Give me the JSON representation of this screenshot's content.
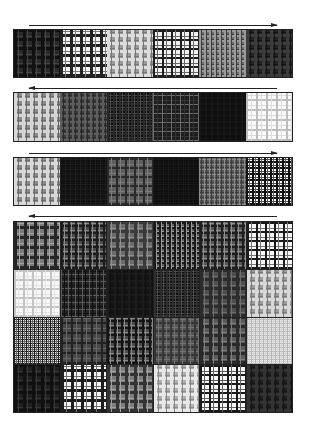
{
  "figure": {
    "arrows": [
      {
        "id": "arrow-1",
        "direction": "right",
        "top": 25,
        "left": 29,
        "width": 248
      },
      {
        "id": "arrow-2",
        "direction": "left",
        "top": 88,
        "left": 29,
        "width": 248
      },
      {
        "id": "arrow-3",
        "direction": "right",
        "top": 153,
        "left": 29,
        "width": 248
      },
      {
        "id": "arrow-4",
        "direction": "left",
        "top": 216,
        "left": 29,
        "width": 248
      }
    ],
    "strips": [
      {
        "id": "strip-1",
        "top": 29,
        "height": 49,
        "tiles": [
          {
            "bg": "#2a2a2a",
            "line": "#111111",
            "line2": "#444444",
            "period": 9,
            "width": 3
          },
          {
            "bg": "#f4f4f4",
            "line": "#222222",
            "line2": "#7a7a7a",
            "period": 10,
            "width": 3
          },
          {
            "bg": "#9a9a9a",
            "line": "#dcdcdc",
            "line2": "#777777",
            "period": 8,
            "width": 3
          },
          {
            "bg": "#f0f0f0",
            "line": "#1e1e1e",
            "line2": "#666666",
            "period": 9,
            "width": 2
          },
          {
            "bg": "#6d6d6d",
            "line": "#9a9a9a",
            "line2": "#3d3d3d",
            "period": 5,
            "width": 2
          },
          {
            "bg": "#232323",
            "line": "#3c3c3c",
            "line2": "#151515",
            "period": 8,
            "width": 3
          }
        ]
      },
      {
        "id": "strip-2",
        "top": 92,
        "height": 50,
        "tiles": [
          {
            "bg": "#8a8a8a",
            "line": "#d6d6d6",
            "line2": "#6a6a6a",
            "period": 8,
            "width": 3
          },
          {
            "bg": "#3e3e3e",
            "line": "#5e5e5e",
            "line2": "#2a2a2a",
            "period": 6,
            "width": 2
          },
          {
            "bg": "#0e0e0e",
            "line": "#2a2a2a",
            "line2": "#4a4a4a",
            "period": 6,
            "width": 2
          },
          {
            "bg": "#1e1e1e",
            "line": "#6a6a6a",
            "line2": "#333333",
            "period": 9,
            "width": 1
          },
          {
            "bg": "#0c0c0c",
            "line": "#161616",
            "line2": "#111111",
            "period": 6,
            "width": 2
          },
          {
            "bg": "#fafafa",
            "line": "#bdbdbd",
            "line2": "#dddddd",
            "period": 10,
            "width": 2
          }
        ]
      },
      {
        "id": "strip-3",
        "top": 157,
        "height": 49,
        "tiles": [
          {
            "bg": "#8c8c8c",
            "line": "#d9d9d9",
            "line2": "#6e6e6e",
            "period": 8,
            "width": 3
          },
          {
            "bg": "#0d0d0d",
            "line": "#1f1f1f",
            "line2": "#161616",
            "period": 5,
            "width": 1
          },
          {
            "bg": "#5e5e5e",
            "line": "#2a2a2a",
            "line2": "#7b7b7b",
            "period": 9,
            "width": 2
          },
          {
            "bg": "#0c0c0c",
            "line": "#1a1a1a",
            "line2": "#141414",
            "period": 5,
            "width": 1
          },
          {
            "bg": "#5a5a5a",
            "line": "#8a8a8a",
            "line2": "#3d3d3d",
            "period": 5,
            "width": 1
          },
          {
            "bg": "#ffffff",
            "line": "#111111",
            "line2": "#555555",
            "period": 6,
            "width": 2
          }
        ]
      }
    ],
    "grid": {
      "id": "grid-4x6",
      "rows": 4,
      "cols": 6,
      "tiles": [
        {
          "bg": "#7a7a7a",
          "line": "#262626",
          "line2": "#a5a5a5",
          "period": 10,
          "width": 3
        },
        {
          "bg": "#4a4a4a",
          "line": "#1c1c1c",
          "line2": "#8a8a8a",
          "period": 7,
          "width": 2
        },
        {
          "bg": "#6c6c6c",
          "line": "#3a3a3a",
          "line2": "#8f8f8f",
          "period": 9,
          "width": 3
        },
        {
          "bg": "#5c5c5c",
          "line": "#1a1a1a",
          "line2": "#9a9a9a",
          "period": 5,
          "width": 2
        },
        {
          "bg": "#555555",
          "line": "#1e1e1e",
          "line2": "#8d8d8d",
          "period": 7,
          "width": 2
        },
        {
          "bg": "#f6f6f6",
          "line": "#1a1a1a",
          "line2": "#777777",
          "period": 9,
          "width": 2
        },
        {
          "bg": "#f8f8f8",
          "line": "#c4c4c4",
          "line2": "#e4e4e4",
          "period": 9,
          "width": 2
        },
        {
          "bg": "#222222",
          "line": "#5a5a5a",
          "line2": "#111111",
          "period": 7,
          "width": 1
        },
        {
          "bg": "#141414",
          "line": "#1c1c1c",
          "line2": "#101010",
          "period": 7,
          "width": 2
        },
        {
          "bg": "#101010",
          "line": "#2e2e2e",
          "line2": "#4a4a4a",
          "period": 6,
          "width": 2
        },
        {
          "bg": "#4e4e4e",
          "line": "#2c2c2c",
          "line2": "#6e6e6e",
          "period": 9,
          "width": 3
        },
        {
          "bg": "#9a9a9a",
          "line": "#d8d8d8",
          "line2": "#7a7a7a",
          "period": 8,
          "width": 3
        },
        {
          "bg": "#e6e6e6",
          "line": "#1e1e1e",
          "line2": "#666666",
          "period": 4,
          "width": 1
        },
        {
          "bg": "#474747",
          "line": "#222222",
          "line2": "#686868",
          "period": 10,
          "width": 2
        },
        {
          "bg": "#4a4a4a",
          "line": "#141414",
          "line2": "#888888",
          "period": 7,
          "width": 2
        },
        {
          "bg": "#555555",
          "line": "#363636",
          "line2": "#727272",
          "period": 8,
          "width": 2
        },
        {
          "bg": "#5a5a5a",
          "line": "#2a2a2a",
          "line2": "#7e7e7e",
          "period": 9,
          "width": 3
        },
        {
          "bg": "#ededed",
          "line": "#b4b4b4",
          "line2": "#d4d4d4",
          "period": 4,
          "width": 1
        },
        {
          "bg": "#202020",
          "line": "#101010",
          "line2": "#363636",
          "period": 9,
          "width": 3
        },
        {
          "bg": "#f4f4f4",
          "line": "#1e1e1e",
          "line2": "#707070",
          "period": 10,
          "width": 3
        },
        {
          "bg": "#7c7c7c",
          "line": "#333333",
          "line2": "#a0a0a0",
          "period": 9,
          "width": 3
        },
        {
          "bg": "#b0b0b0",
          "line": "#e8e8e8",
          "line2": "#8a8a8a",
          "period": 8,
          "width": 3
        },
        {
          "bg": "#f6f6f6",
          "line": "#1a1a1a",
          "line2": "#606060",
          "period": 9,
          "width": 2
        },
        {
          "bg": "#1e1e1e",
          "line": "#343434",
          "line2": "#141414",
          "period": 8,
          "width": 3
        }
      ]
    }
  }
}
